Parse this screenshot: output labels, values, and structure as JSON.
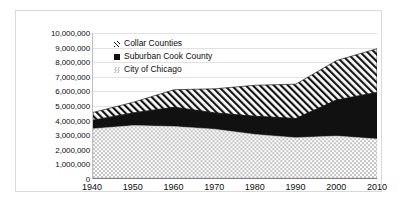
{
  "chart_data": {
    "type": "area",
    "stacked": true,
    "title": "",
    "xlabel": "",
    "ylabel": "",
    "xlim": [
      1940,
      2010
    ],
    "ylim": [
      0,
      10000000
    ],
    "grid": true,
    "legend_position": "top-left",
    "x_ticks": [
      "1940",
      "1950",
      "1960",
      "1970",
      "1980",
      "1990",
      "2000",
      "2010"
    ],
    "x_tick_values": [
      1940,
      1950,
      1960,
      1970,
      1980,
      1990,
      2000,
      2010
    ],
    "y_ticks": [
      "0",
      "1,000,000",
      "2,000,000",
      "3,000,000",
      "4,000,000",
      "5,000,000",
      "6,000,000",
      "7,000,000",
      "8,000,000",
      "9,000,000",
      "10,000,000"
    ],
    "y_tick_values": [
      0,
      1000000,
      2000000,
      3000000,
      4000000,
      5000000,
      6000000,
      7000000,
      8000000,
      9000000,
      10000000
    ],
    "x": [
      1940,
      1950,
      1960,
      1970,
      1980,
      1990,
      2000,
      2010
    ],
    "series": [
      {
        "name": "City of Chicago",
        "key": "chicago",
        "pattern": "light-gray-checker",
        "color": "#d0d0d0",
        "values": [
          3400000,
          3620000,
          3550000,
          3370000,
          3005000,
          2783000,
          2896000,
          2696000
        ]
      },
      {
        "name": "Suburban Cook County",
        "key": "suburban",
        "pattern": "solid-black",
        "color": "#111111",
        "values": [
          580000,
          870000,
          1330000,
          1120000,
          1250000,
          1320000,
          2480000,
          3200000
        ]
      },
      {
        "name": "Collar Counties",
        "key": "collar",
        "pattern": "diagonal-hatch",
        "color": "#111111",
        "values": [
          540000,
          740000,
          1210000,
          1660000,
          2140000,
          2370000,
          2720000,
          3020000
        ]
      }
    ],
    "stack_totals": [
      4520000,
      5230000,
      6090000,
      6150000,
      6395000,
      6473000,
      8096000,
      8916000
    ]
  },
  "legend": {
    "items": [
      {
        "label": "Collar Counties",
        "swatch": "collar-hatch-swatch"
      },
      {
        "label": "Suburban Cook County",
        "swatch": "suburban-black-swatch"
      },
      {
        "label": "City of Chicago",
        "swatch": "chicago-gray-swatch"
      }
    ]
  }
}
